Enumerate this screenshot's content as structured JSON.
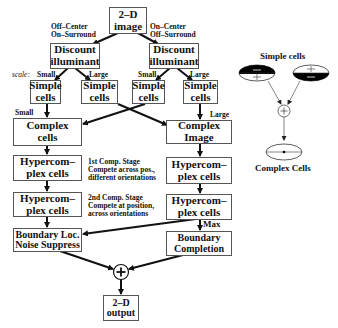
{
  "flowchart": {
    "input": {
      "line1": "2–D",
      "line2": "image"
    },
    "left_path_label": {
      "line1": "Off–Center",
      "line2": "On–Surround"
    },
    "right_path_label": {
      "line1": "On–Center",
      "line2": "Off–Surround"
    },
    "discount_left": {
      "line1": "Discount",
      "line2": "illuminant"
    },
    "discount_right": {
      "line1": "Discount",
      "line2": "illuminant"
    },
    "scale_label": "scale:",
    "simple_cells": [
      {
        "scale": "Small",
        "line1": "Simple",
        "line2": "cells"
      },
      {
        "scale": "Large",
        "line1": "Simple",
        "line2": "cells"
      },
      {
        "scale": "Small",
        "line1": "Simple",
        "line2": "cells"
      },
      {
        "scale": "Large",
        "line1": "Simple",
        "line2": "cells"
      }
    ],
    "small_label": "Small",
    "large_label": "Large",
    "complex_left": {
      "line1": "Complex",
      "line2": "cells"
    },
    "complex_right": {
      "line1": "Complex",
      "line2": "Image"
    },
    "hyper1_left": {
      "line1": "Hypercom–",
      "line2": "plex cells"
    },
    "hyper1_right": {
      "line1": "Hypercom–",
      "line2": "plex cells"
    },
    "hyper2_left": {
      "line1": "Hypercom–",
      "line2": "plex cells"
    },
    "hyper2_right": {
      "line1": "Hypercom–",
      "line2": "plex cells"
    },
    "stage1_note": {
      "line1": "1st Comp. Stage",
      "line2": "Compete across pos.,",
      "line3": "different orientations"
    },
    "stage2_note": {
      "line1": "2nd Comp. Stage",
      "line2": "Compete at position,",
      "line3": "across orientations"
    },
    "max_label": "Max",
    "boundary_left": {
      "line1": "Boundary Loc.",
      "line2": "Noise Suppress"
    },
    "boundary_right": {
      "line1": "Boundary",
      "line2": "Completion"
    },
    "sum_symbol": "+",
    "output": {
      "line1": "2–D",
      "line2": "output"
    }
  },
  "inset": {
    "title": "Simple cells",
    "bottom_label": "Complex Cells",
    "sum_symbol": "+"
  }
}
